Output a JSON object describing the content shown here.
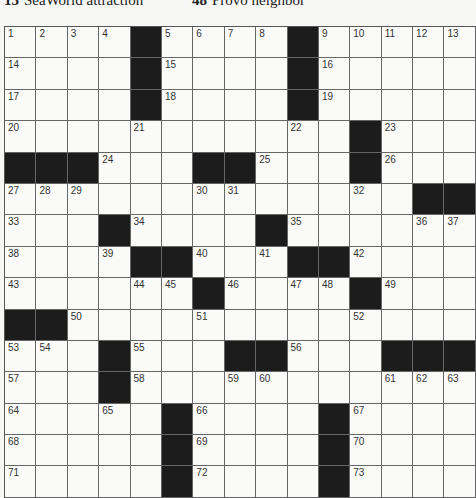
{
  "clue_strip": [
    {
      "number": "13",
      "text": "SeaWorld attraction",
      "x": 4
    },
    {
      "number": "48",
      "text": "Provo neighbor",
      "x": 192
    }
  ],
  "grid": {
    "size": 15,
    "rows": [
      [
        "1",
        "2",
        "3",
        "4",
        "#",
        "5",
        "6",
        "7",
        "8",
        "#",
        "9",
        "10",
        "11",
        "12",
        "13"
      ],
      [
        "14",
        ".",
        ".",
        ".",
        "#",
        "15",
        ".",
        ".",
        ".",
        "#",
        "16",
        ".",
        ".",
        ".",
        "."
      ],
      [
        "17",
        ".",
        ".",
        ".",
        "#",
        "18",
        ".",
        ".",
        ".",
        "#",
        "19",
        ".",
        ".",
        ".",
        "."
      ],
      [
        "20",
        ".",
        ".",
        ".",
        "21",
        ".",
        ".",
        ".",
        ".",
        "22",
        ".",
        "#",
        "23",
        ".",
        "."
      ],
      [
        "#",
        "#",
        "#",
        "24",
        ".",
        ".",
        "#",
        "#",
        "25",
        ".",
        ".",
        "#",
        "26",
        ".",
        "."
      ],
      [
        "27",
        "28",
        "29",
        ".",
        ".",
        ".",
        "30",
        "31",
        ".",
        ".",
        ".",
        "32",
        ".",
        "#",
        "#"
      ],
      [
        "33",
        ".",
        ".",
        "#",
        "34",
        ".",
        ".",
        ".",
        "#",
        "35",
        ".",
        ".",
        ".",
        "36",
        "37"
      ],
      [
        "38",
        ".",
        ".",
        "39",
        "#",
        "#",
        "40",
        ".",
        "41",
        "#",
        "#",
        "42",
        ".",
        ".",
        "."
      ],
      [
        "43",
        ".",
        ".",
        ".",
        "44",
        "45",
        "#",
        "46",
        ".",
        "47",
        "48",
        "#",
        "49",
        ".",
        "."
      ],
      [
        "#",
        "#",
        "50",
        ".",
        ".",
        ".",
        "51",
        ".",
        ".",
        ".",
        ".",
        "52",
        ".",
        ".",
        "."
      ],
      [
        "53",
        "54",
        ".",
        "#",
        "55",
        ".",
        ".",
        "#",
        "#",
        "56",
        ".",
        ".",
        "#",
        "#",
        "#"
      ],
      [
        "57",
        ".",
        ".",
        "#",
        "58",
        ".",
        ".",
        "59",
        "60",
        ".",
        ".",
        ".",
        "61",
        "62",
        "63"
      ],
      [
        "64",
        ".",
        ".",
        "65",
        ".",
        "#",
        "66",
        ".",
        ".",
        ".",
        "#",
        "67",
        ".",
        ".",
        "."
      ],
      [
        "68",
        ".",
        ".",
        ".",
        ".",
        "#",
        "69",
        ".",
        ".",
        ".",
        "#",
        "70",
        ".",
        ".",
        "."
      ],
      [
        "71",
        ".",
        ".",
        ".",
        ".",
        "#",
        "72",
        ".",
        ".",
        ".",
        "#",
        "73",
        ".",
        ".",
        "."
      ]
    ]
  }
}
